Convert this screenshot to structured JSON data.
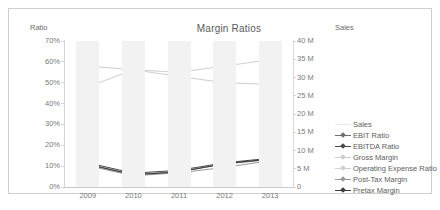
{
  "chart_data": {
    "type": "line",
    "title": "Margin Ratios",
    "xlabel": "",
    "ylabel": "Ratio",
    "y2label": "Sales",
    "categories": [
      "2009",
      "2010",
      "2011",
      "2012",
      "2013"
    ],
    "ylim": [
      0,
      70
    ],
    "y2lim": [
      0,
      40
    ],
    "ytick_labels": [
      "70%",
      "60%",
      "50%",
      "40%",
      "30%",
      "20%",
      "10%",
      "0%"
    ],
    "ytick_values": [
      70,
      60,
      50,
      40,
      30,
      20,
      10,
      0
    ],
    "y2tick_labels": [
      "40 M",
      "35 M",
      "30 M",
      "25 M",
      "20 M",
      "15 M",
      "10 M",
      "5 M",
      "0"
    ],
    "y2tick_values": [
      40,
      35,
      30,
      25,
      20,
      15,
      10,
      5,
      0
    ],
    "grid": false,
    "alternating_bands": true,
    "legend_position": "right",
    "series": [
      {
        "name": "Sales",
        "axis": "y2",
        "color": "#e8e8e8",
        "marker": "none",
        "values": [
          null,
          null,
          null,
          null,
          null
        ]
      },
      {
        "name": "EBIT Ratio",
        "axis": "y",
        "color": "#6f6f6f",
        "marker": "diamond",
        "values": [
          11.0,
          6.0,
          7.4,
          11.0,
          13.2
        ]
      },
      {
        "name": "EBITDA Ratio",
        "axis": "y",
        "color": "#4a4a4a",
        "marker": "diamond",
        "values": [
          11.6,
          6.6,
          8.0,
          11.6,
          13.8
        ]
      },
      {
        "name": "Gross Margin",
        "axis": "y",
        "color": "#cfcfcf",
        "marker": "diamond",
        "values": [
          48.0,
          56.2,
          55.0,
          58.0,
          61.0
        ]
      },
      {
        "name": "Operating Expense Ratio",
        "axis": "y",
        "color": "#cfcfcf",
        "marker": "diamond",
        "values": [
          58.0,
          56.2,
          53.0,
          50.0,
          49.2
        ]
      },
      {
        "name": "Post-Tax Margin",
        "axis": "y",
        "color": "#9a9a9a",
        "marker": "diamond",
        "values": [
          10.2,
          5.4,
          6.8,
          9.4,
          12.6
        ]
      },
      {
        "name": "Pretax Margin",
        "axis": "y",
        "color": "#3d3d3d",
        "marker": "diamond",
        "values": [
          10.8,
          5.8,
          7.2,
          11.2,
          13.4
        ]
      }
    ]
  }
}
